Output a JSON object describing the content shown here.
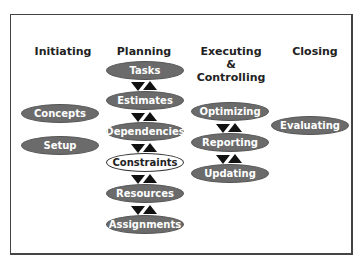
{
  "columns": [
    {
      "id": "initiating",
      "header": "Initiating",
      "nodes": [
        "Concepts",
        "Setup"
      ]
    },
    {
      "id": "planning",
      "header": "Planning",
      "nodes": [
        "Tasks",
        "Estimates",
        "Dependencies",
        "Constraints",
        "Resources",
        "Assignments"
      ]
    },
    {
      "id": "executing",
      "header_lines": [
        "Executing",
        "&",
        "Controlling"
      ],
      "nodes": [
        "Optimizing",
        "Reporting",
        "Updating"
      ]
    },
    {
      "id": "closing",
      "header": "Closing",
      "nodes": [
        "Evaluating"
      ]
    }
  ],
  "highlighted_node": "Constraints",
  "colors": {
    "node_fill": "#6b6b6b",
    "node_text": "#ffffff",
    "highlight_fill": "#ffffff",
    "arrow": "#111111"
  }
}
